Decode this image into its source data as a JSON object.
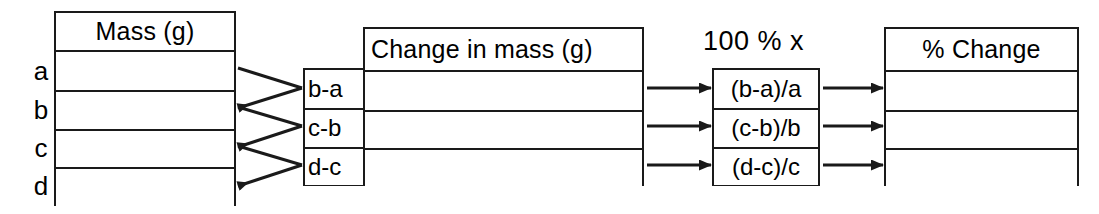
{
  "diagram": {
    "ink_color": "#1a1a1a",
    "background": "#ffffff"
  },
  "mass_table": {
    "header": "Mass (g)",
    "row_labels": [
      "a",
      "b",
      "c",
      "d"
    ],
    "cells": [
      "",
      "",
      "",
      ""
    ]
  },
  "difference_labels": {
    "items": [
      "b-a",
      "c-b",
      "d-c"
    ]
  },
  "change_table": {
    "header": "Change in mass (g)",
    "cells": [
      "",
      "",
      ""
    ]
  },
  "percent_caption": {
    "text": "100 % x"
  },
  "formula_table": {
    "items": [
      "(b-a)/a",
      "(c-b)/b",
      "(d-c)/c"
    ]
  },
  "percent_change_table": {
    "header": "% Change",
    "cells": [
      "",
      "",
      ""
    ]
  },
  "connectors": {
    "mass_to_difference": [
      {
        "from": [
          "a",
          "b"
        ],
        "to": "b-a"
      },
      {
        "from": [
          "b",
          "c"
        ],
        "to": "c-b"
      },
      {
        "from": [
          "c",
          "d"
        ],
        "to": "d-c"
      }
    ],
    "change_to_formula": [
      {
        "from": "change-row-1",
        "to": "(b-a)/a"
      },
      {
        "from": "change-row-2",
        "to": "(c-b)/b"
      },
      {
        "from": "change-row-3",
        "to": "(d-c)/c"
      }
    ],
    "formula_to_percent_change": [
      {
        "from": "(b-a)/a",
        "to": "pct-row-1"
      },
      {
        "from": "(c-b)/b",
        "to": "pct-row-2"
      },
      {
        "from": "(d-c)/c",
        "to": "pct-row-3"
      }
    ]
  }
}
